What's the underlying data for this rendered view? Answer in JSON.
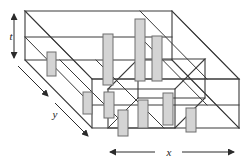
{
  "figure": {
    "name": "space-time-volume-diagram",
    "background_color": "#ffffff",
    "line_color": "#3a3a3a",
    "bar_fill_color": "#d4d4d4",
    "bar_stroke_color": "#6e6e6e",
    "axis_color": "#2b2b2b"
  },
  "axes": [
    {
      "id": "t",
      "label": "t",
      "orientation": "vertical",
      "arrow": "double",
      "label_x": 14,
      "label_y": 40
    },
    {
      "id": "y",
      "label": "y",
      "orientation": "diagonal-down-right",
      "arrow": "double",
      "label_x": 55,
      "label_y": 116
    },
    {
      "id": "x",
      "label": "x",
      "orientation": "horizontal",
      "arrow": "double",
      "label_x": 168,
      "label_y": 157
    }
  ],
  "geometry": {
    "box_outer": {
      "front_top_left": [
        25,
        11
      ],
      "front_top_right": [
        172,
        11
      ],
      "front_bottom_left": [
        25,
        60
      ],
      "front_bottom_right": [
        172,
        60
      ],
      "depth_dx": 67,
      "depth_dy": 68
    },
    "box_inner": {
      "front_top_left": [
        108,
        89
      ],
      "front_top_right": [
        175,
        89
      ],
      "front_bottom_left": [
        108,
        128
      ],
      "front_bottom_right": [
        175,
        128
      ],
      "depth_dx": 30,
      "depth_dy": 30
    }
  },
  "bars": [
    {
      "x": 47,
      "y": 52,
      "w": 9,
      "h": 24
    },
    {
      "x": 103,
      "y": 34,
      "w": 10,
      "h": 51
    },
    {
      "x": 135,
      "y": 19,
      "w": 10,
      "h": 62
    },
    {
      "x": 152,
      "y": 36,
      "w": 10,
      "h": 45
    },
    {
      "x": 83,
      "y": 92,
      "w": 9,
      "h": 22
    },
    {
      "x": 104,
      "y": 92,
      "w": 10,
      "h": 26
    },
    {
      "x": 118,
      "y": 110,
      "w": 10,
      "h": 26
    },
    {
      "x": 138,
      "y": 100,
      "w": 10,
      "h": 28
    },
    {
      "x": 163,
      "y": 93,
      "w": 10,
      "h": 32
    },
    {
      "x": 186,
      "y": 108,
      "w": 10,
      "h": 24
    }
  ],
  "labels": {
    "t": "t",
    "y": "y",
    "x": "x"
  }
}
